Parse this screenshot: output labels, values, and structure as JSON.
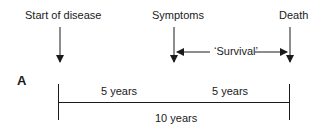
{
  "events": [
    {
      "label": "Start of disease",
      "x": 60
    },
    {
      "label": "Symptoms",
      "x": 174
    },
    {
      "label": "Death",
      "x": 290
    }
  ],
  "survival_label": "‘Survival’",
  "panel_label": "A",
  "segments": [
    {
      "label": "5 years"
    },
    {
      "label": "5 years"
    }
  ],
  "total_label": "10 years",
  "colors": {
    "line": "#1a1a1a",
    "background": "#ffffff"
  }
}
